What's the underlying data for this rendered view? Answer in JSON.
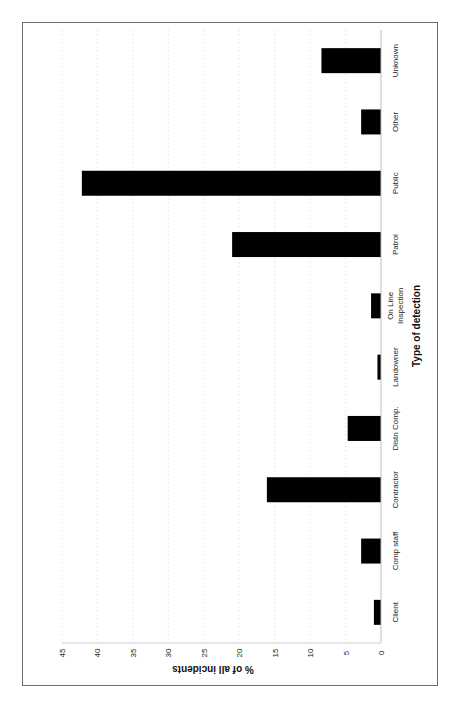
{
  "chart_data": {
    "type": "bar",
    "orientation": "rotated-90-clockwise (vertical bar chart printed sideways)",
    "title": "",
    "xlabel": "Type of detection",
    "ylabel": "% of all incidents",
    "categories": [
      "Client",
      "Comp staff",
      "Contractor",
      "Distn Comp.",
      "Landowner",
      "On Line Inspection",
      "Patrol",
      "Public",
      "Other",
      "Unknown"
    ],
    "values": [
      1.0,
      2.8,
      16.1,
      4.7,
      0.5,
      1.4,
      21.0,
      42.2,
      2.8,
      8.4
    ],
    "ylim": [
      0,
      45
    ],
    "yticks": [
      0,
      5,
      10,
      15,
      20,
      25,
      30,
      35,
      40,
      45
    ],
    "grid": true,
    "legend": null,
    "bar_color": "#000000"
  }
}
